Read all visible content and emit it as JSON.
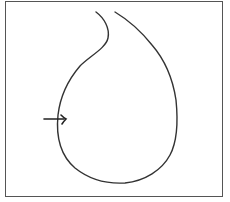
{
  "figure": {
    "stroke_color": "#333333",
    "frame_color": "#555555",
    "background": "#ffffff",
    "shape": {
      "name": "teardrop-outline",
      "path": "M96,12 C104,18 110,28 108,38 C106,48 90,56 80,66 C68,80 60,98 58,115 C56,135 60,155 75,168 C90,180 108,184 125,183 C145,181 162,170 170,155 C178,140 178,120 176,100 C173,80 165,60 152,45 C140,30 125,18 115,12"
    },
    "arrow": {
      "name": "pointer-arrow",
      "x1": 44,
      "y1": 119,
      "x2": 66,
      "y2": 119
    }
  }
}
